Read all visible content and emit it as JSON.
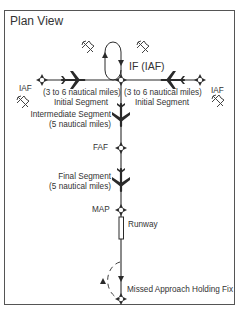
{
  "title": "Plan View",
  "fixes": {
    "if": "IF (IAF)",
    "iaf_left": "IAF",
    "iaf_right": "IAF",
    "faf": "FAF",
    "map": "MAP",
    "missed_hold": "Missed Approach Holding Fix"
  },
  "segments": {
    "initial_left": {
      "distance": "(3 to 6 nautical miles)",
      "name": "Initial Segment"
    },
    "initial_right": {
      "distance": "(3 to 6 nautical miles)",
      "name": "Initial Segment"
    },
    "intermediate": {
      "name": "Intermediate Segment",
      "distance": "(5 nautical miles)"
    },
    "final": {
      "name": "Final Segment",
      "distance": "(5 nautical miles)"
    }
  },
  "runway": "Runway",
  "colors": {
    "line": "#2a2a2a",
    "frame": "#555555",
    "background": "#ffffff"
  }
}
